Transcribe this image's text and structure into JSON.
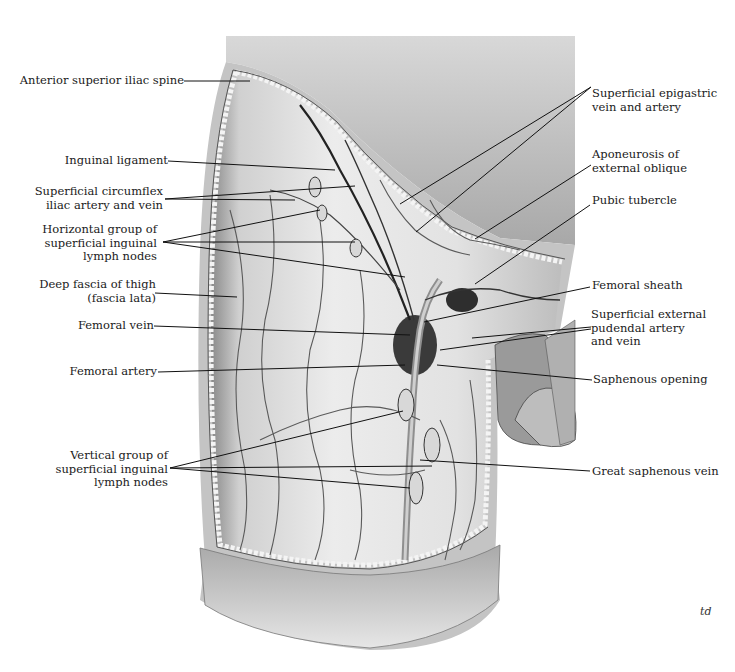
{
  "figure": {
    "signature": "td",
    "colors": {
      "background": "#ffffff",
      "skin_flap": "#c9c9c9",
      "fascia": "#e4e4e4",
      "vessels": "#2a2a2a",
      "label_text": "#1a1a1a",
      "leader_lines": "#111111"
    }
  },
  "labels_left": [
    {
      "id": "anterior-superior-iliac-spine",
      "lines": [
        "Anterior superior iliac spine"
      ]
    },
    {
      "id": "inguinal-ligament",
      "lines": [
        "Inguinal ligament"
      ]
    },
    {
      "id": "superficial-circumflex-iliac",
      "lines": [
        "Superficial circumflex",
        "iliac artery and vein"
      ]
    },
    {
      "id": "horizontal-group-nodes",
      "lines": [
        "Horizontal group of",
        "superficial inguinal",
        "lymph nodes"
      ]
    },
    {
      "id": "deep-fascia-of-thigh",
      "lines": [
        "Deep fascia of thigh",
        "(fascia lata)"
      ]
    },
    {
      "id": "femoral-vein",
      "lines": [
        "Femoral vein"
      ]
    },
    {
      "id": "femoral-artery",
      "lines": [
        "Femoral artery"
      ]
    },
    {
      "id": "vertical-group-nodes",
      "lines": [
        "Vertical group of",
        "superficial inguinal",
        "lymph nodes"
      ]
    }
  ],
  "labels_right": [
    {
      "id": "superficial-epigastric",
      "lines": [
        "Superficial epigastric",
        "vein and artery"
      ]
    },
    {
      "id": "aponeurosis-external-oblique",
      "lines": [
        "Aponeurosis of",
        "external oblique"
      ]
    },
    {
      "id": "pubic-tubercle",
      "lines": [
        "Pubic tubercle"
      ]
    },
    {
      "id": "femoral-sheath",
      "lines": [
        "Femoral sheath"
      ]
    },
    {
      "id": "superficial-external-pudendal",
      "lines": [
        "Superficial external",
        "pudendal artery",
        "and vein"
      ]
    },
    {
      "id": "saphenous-opening",
      "lines": [
        "Saphenous opening"
      ]
    },
    {
      "id": "great-saphenous-vein",
      "lines": [
        "Great saphenous vein"
      ]
    }
  ]
}
